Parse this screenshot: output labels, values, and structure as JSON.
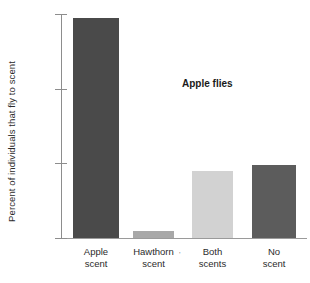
{
  "chart_data": {
    "type": "bar",
    "title": "Apple flies",
    "xlabel": "",
    "ylabel": "Percent of individuals that fly to scent",
    "categories": [
      "Apple scent",
      "Hawthorn scent",
      "Both scents",
      "No scent"
    ],
    "category_lines": [
      [
        "Apple",
        "scent"
      ],
      [
        "Hawthorn",
        "scent"
      ],
      [
        "Both",
        "scents"
      ],
      [
        "No",
        "scent"
      ]
    ],
    "values": [
      59,
      2,
      18,
      19.5
    ],
    "ylim": [
      0,
      60
    ],
    "yticks": [
      0,
      20,
      40,
      60
    ],
    "ytick_labels": [
      "0",
      "20",
      "40",
      "60"
    ],
    "grid": false,
    "legend": false,
    "bar_colors": [
      "#4a4a4a",
      "#a8a8a8",
      "#d2d2d2",
      "#5c5c5c"
    ]
  },
  "marks": {
    "stray_tick": "'"
  }
}
